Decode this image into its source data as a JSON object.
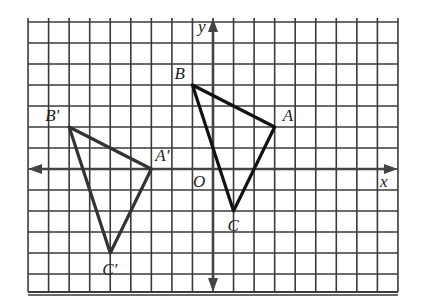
{
  "figure": {
    "type": "coordinate-grid-translation",
    "grid": {
      "x_min": -9,
      "x_max": 9,
      "y_min": -6,
      "y_max": 7,
      "origin_px": [
        213,
        169
      ],
      "unit_px_x": 20.55,
      "unit_px_y": 21.0,
      "line_color": "#3a3a3a",
      "axis_color": "#444444"
    },
    "axes": {
      "x_label": "x",
      "y_label": "y",
      "origin_label": "O"
    },
    "triangles": [
      {
        "name": "ABC",
        "color": "#111111",
        "vertices": [
          {
            "label": "A",
            "x": 3,
            "y": 2,
            "label_dx": 8,
            "label_dy": -6
          },
          {
            "label": "B",
            "x": -1,
            "y": 4,
            "label_dx": -18,
            "label_dy": -6
          },
          {
            "label": "C",
            "x": 1,
            "y": -2,
            "label_dx": -6,
            "label_dy": 20
          }
        ]
      },
      {
        "name": "A'B'C'",
        "color": "#333333",
        "vertices": [
          {
            "label": "A'",
            "x": -3,
            "y": 0,
            "label_dx": 4,
            "label_dy": -8
          },
          {
            "label": "B'",
            "x": -7,
            "y": 2,
            "label_dx": -24,
            "label_dy": -6
          },
          {
            "label": "C'",
            "x": -5,
            "y": -4,
            "label_dx": -8,
            "label_dy": 22
          }
        ]
      }
    ]
  }
}
